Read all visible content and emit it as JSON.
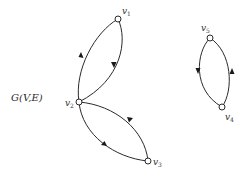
{
  "graph": {
    "title": "G(V,E)",
    "title_parts": {
      "g": "G",
      "args": "(V,E)"
    },
    "nodes": [
      {
        "id": "v1",
        "base": "v",
        "sub": "1"
      },
      {
        "id": "v2",
        "base": "v",
        "sub": "2"
      },
      {
        "id": "v3",
        "base": "v",
        "sub": "3"
      },
      {
        "id": "v4",
        "base": "v",
        "sub": "4"
      },
      {
        "id": "v5",
        "base": "v",
        "sub": "5"
      }
    ],
    "edges": [
      {
        "from": "v2",
        "to": "v1",
        "curve": "left"
      },
      {
        "from": "v1",
        "to": "v2",
        "curve": "right"
      },
      {
        "from": "v3",
        "to": "v2",
        "curve": "upper"
      },
      {
        "from": "v2",
        "to": "v3",
        "curve": "lower"
      },
      {
        "from": "v5",
        "to": "v4",
        "curve": "left"
      },
      {
        "from": "v4",
        "to": "v5",
        "curve": "right"
      }
    ],
    "components": 2
  },
  "colors": {
    "stroke": "#2a2a2a",
    "background": "#ffffff"
  }
}
